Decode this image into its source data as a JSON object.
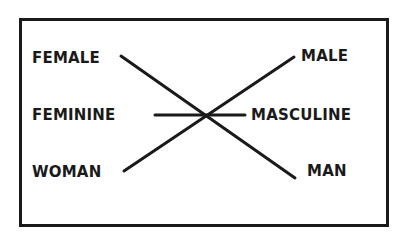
{
  "diagram": {
    "left_labels": {
      "female": "FEMALE",
      "feminine": "FEMININE",
      "woman": "WOMAN"
    },
    "right_labels": {
      "male": "MALE",
      "masculine": "MASCULINE",
      "man": "MAN"
    },
    "connections": [
      {
        "from": "FEMALE",
        "to": "MAN"
      },
      {
        "from": "FEMININE",
        "to": "MASCULINE"
      },
      {
        "from": "WOMAN",
        "to": "MALE"
      }
    ],
    "colors": {
      "ink": "#1a1a1a",
      "background": "#ffffff"
    }
  }
}
